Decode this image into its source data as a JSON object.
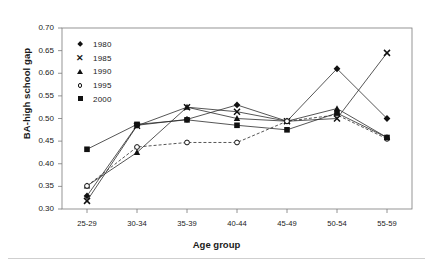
{
  "chart_data": {
    "type": "line",
    "title": "",
    "xlabel": "Age group",
    "ylabel": "BA-high school gap",
    "categories": [
      "25-29",
      "30-34",
      "35-39",
      "40-44",
      "45-49",
      "50-54",
      "55-59"
    ],
    "ylim": [
      0.3,
      0.7
    ],
    "yticks": [
      "0.30",
      "0.35",
      "0.40",
      "0.45",
      "0.50",
      "0.55",
      "0.60",
      "0.65",
      "0.70"
    ],
    "ytick_values": [
      0.3,
      0.35,
      0.4,
      0.45,
      0.5,
      0.55,
      0.6,
      0.65,
      0.7
    ],
    "grid": false,
    "legend_position": "upper-left-inside",
    "series": [
      {
        "name": "1980",
        "marker": "diamond",
        "line": "solid",
        "values": [
          0.329,
          0.485,
          0.498,
          0.53,
          0.494,
          0.61,
          0.5
        ]
      },
      {
        "name": "1985",
        "marker": "x",
        "line": "solid",
        "values": [
          0.318,
          0.484,
          0.525,
          0.515,
          0.494,
          0.5,
          0.645
        ]
      },
      {
        "name": "1990",
        "marker": "triangle",
        "line": "solid",
        "values": [
          0.351,
          0.425,
          0.525,
          0.5,
          0.494,
          0.522,
          0.458
        ]
      },
      {
        "name": "1995",
        "marker": "circle-open",
        "line": "dashed",
        "values": [
          0.351,
          0.437,
          0.447,
          0.447,
          0.494,
          0.508,
          0.455
        ]
      },
      {
        "name": "2000",
        "marker": "square",
        "line": "solid",
        "values": [
          0.432,
          0.487,
          0.497,
          0.485,
          0.475,
          0.512,
          0.458
        ]
      }
    ]
  },
  "legend": {
    "items": [
      {
        "label": "1980",
        "marker": "diamond-icon"
      },
      {
        "label": "1985",
        "marker": "x-icon"
      },
      {
        "label": "1990",
        "marker": "triangle-icon"
      },
      {
        "label": "1995",
        "marker": "open-circle-icon"
      },
      {
        "label": "2000",
        "marker": "square-icon"
      }
    ]
  }
}
